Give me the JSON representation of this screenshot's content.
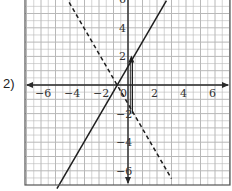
{
  "problem": {
    "label": "2)"
  },
  "colors": {
    "grid": "#b8b8b8",
    "axis": "#2a2a2a",
    "line": "#1e1e1e",
    "frame": "#555555"
  },
  "chart_data": {
    "type": "line",
    "title": "",
    "xlabel": "",
    "ylabel": "",
    "xlim": [
      -7.1,
      7.0
    ],
    "ylim": [
      -6.9,
      5.9
    ],
    "grid": true,
    "grid_step": 0.5,
    "x_ticks": [
      {
        "value": -6,
        "label": "−6"
      },
      {
        "value": -4,
        "label": "−4"
      },
      {
        "value": -2,
        "label": "−2"
      },
      {
        "value": 0,
        "label": "0"
      },
      {
        "value": 2,
        "label": "2"
      },
      {
        "value": 4,
        "label": "4"
      },
      {
        "value": 6,
        "label": "6"
      }
    ],
    "y_ticks": [
      {
        "value": 6,
        "label": "6"
      },
      {
        "value": 4,
        "label": "4"
      },
      {
        "value": 2,
        "label": "2"
      },
      {
        "value": -2,
        "label": "−2"
      },
      {
        "value": -4,
        "label": "−4"
      },
      {
        "value": -6,
        "label": "−6"
      }
    ],
    "series": [
      {
        "name": "solid line",
        "style": "solid",
        "slope": 1.75,
        "intercept": 1.3,
        "points": [
          [
            -4.9,
            -7.25
          ],
          [
            2.65,
            5.9
          ]
        ]
      },
      {
        "name": "dashed line",
        "style": "dashed",
        "slope": -1.75,
        "intercept": -1.3,
        "points": [
          [
            -4.3,
            6.2
          ],
          [
            3.0,
            -6.55
          ]
        ]
      }
    ],
    "annotations": [
      {
        "type": "vertical-arrow",
        "x": 0.3,
        "y_from": -2.0,
        "y_to": 2.0,
        "head": "up"
      }
    ]
  }
}
